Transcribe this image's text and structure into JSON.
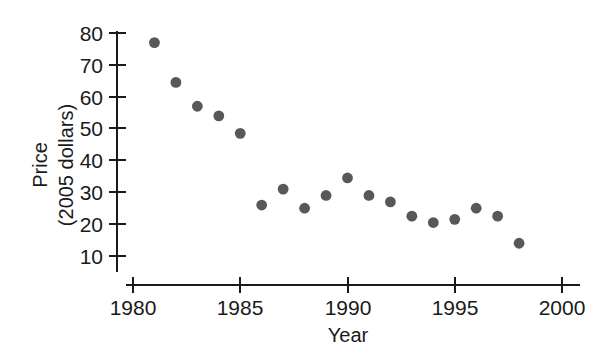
{
  "chart_data": {
    "type": "scatter",
    "title": "",
    "xlabel": "Year",
    "ylabel": "Price\n(2005 dollars)",
    "ylabel_line1": "Price",
    "ylabel_line2": "(2005 dollars)",
    "xlim": [
      1980,
      2000
    ],
    "ylim": [
      5,
      84
    ],
    "xticks": [
      1980,
      1985,
      1990,
      1995,
      2000
    ],
    "xticklabels": [
      "1980",
      "1985",
      "1990",
      "1995",
      "2000"
    ],
    "yticks": [
      10,
      20,
      30,
      40,
      50,
      60,
      70,
      80
    ],
    "yticklabels": [
      "10",
      "20",
      "30",
      "40",
      "50",
      "60",
      "70",
      "80"
    ],
    "grid": false,
    "legend": false,
    "marker_color": "#58585a",
    "axis_color": "#1a1a1a",
    "x": [
      1981,
      1982,
      1983,
      1984,
      1985,
      1986,
      1987,
      1988,
      1989,
      1990,
      1991,
      1992,
      1993,
      1994,
      1995,
      1996,
      1997,
      1998
    ],
    "y": [
      77,
      64.5,
      57,
      54,
      48.5,
      26,
      31,
      25,
      29,
      34.5,
      29,
      27,
      22.5,
      20.5,
      21.5,
      25,
      22.5,
      14
    ],
    "values": [
      {
        "year": 1981,
        "price": 77
      },
      {
        "year": 1982,
        "price": 64.5
      },
      {
        "year": 1983,
        "price": 57
      },
      {
        "year": 1984,
        "price": 54
      },
      {
        "year": 1985,
        "price": 48.5
      },
      {
        "year": 1986,
        "price": 26
      },
      {
        "year": 1987,
        "price": 31
      },
      {
        "year": 1988,
        "price": 25
      },
      {
        "year": 1989,
        "price": 29
      },
      {
        "year": 1990,
        "price": 34.5
      },
      {
        "year": 1991,
        "price": 29
      },
      {
        "year": 1992,
        "price": 27
      },
      {
        "year": 1993,
        "price": 22.5
      },
      {
        "year": 1994,
        "price": 20.5
      },
      {
        "year": 1995,
        "price": 21.5
      },
      {
        "year": 1996,
        "price": 25
      },
      {
        "year": 1997,
        "price": 22.5
      },
      {
        "year": 1998,
        "price": 14
      }
    ]
  }
}
